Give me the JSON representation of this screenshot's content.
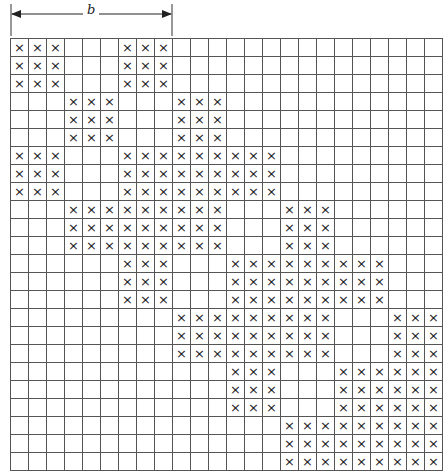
{
  "dimension": {
    "label": "b",
    "from_col": 0,
    "to_col": 9
  },
  "grid": {
    "rows": 24,
    "cols": 24,
    "mark_symbol": "×",
    "marked_blocks": [
      {
        "rows": [
          0,
          2
        ],
        "cols": [
          [
            0,
            2
          ],
          [
            6,
            8
          ]
        ]
      },
      {
        "rows": [
          3,
          5
        ],
        "cols": [
          [
            3,
            5
          ],
          [
            9,
            11
          ]
        ]
      },
      {
        "rows": [
          6,
          8
        ],
        "cols": [
          [
            0,
            2
          ],
          [
            6,
            14
          ]
        ]
      },
      {
        "rows": [
          9,
          11
        ],
        "cols": [
          [
            3,
            11
          ],
          [
            15,
            17
          ]
        ]
      },
      {
        "rows": [
          12,
          14
        ],
        "cols": [
          [
            6,
            8
          ],
          [
            12,
            20
          ]
        ]
      },
      {
        "rows": [
          15,
          17
        ],
        "cols": [
          [
            9,
            17
          ],
          [
            21,
            23
          ]
        ]
      },
      {
        "rows": [
          18,
          20
        ],
        "cols": [
          [
            12,
            14
          ],
          [
            18,
            23
          ]
        ]
      },
      {
        "rows": [
          21,
          23
        ],
        "cols": [
          [
            15,
            23
          ]
        ]
      }
    ]
  },
  "colors": {
    "line": "#555555",
    "mark": "#222222",
    "background": "#ffffff"
  }
}
